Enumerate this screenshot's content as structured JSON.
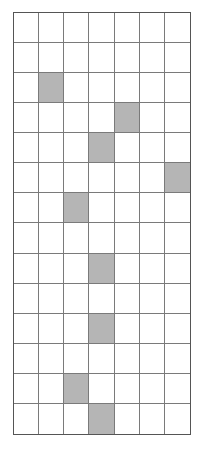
{
  "grid": {
    "rows": 14,
    "cols": 7,
    "shade_color": "#b5b5b5",
    "line_color": "#7a7a7a",
    "shaded_cells": [
      {
        "row": 2,
        "col": 1
      },
      {
        "row": 3,
        "col": 4
      },
      {
        "row": 4,
        "col": 3
      },
      {
        "row": 5,
        "col": 6
      },
      {
        "row": 6,
        "col": 2
      },
      {
        "row": 8,
        "col": 3
      },
      {
        "row": 10,
        "col": 3
      },
      {
        "row": 12,
        "col": 2
      },
      {
        "row": 13,
        "col": 3
      }
    ]
  }
}
